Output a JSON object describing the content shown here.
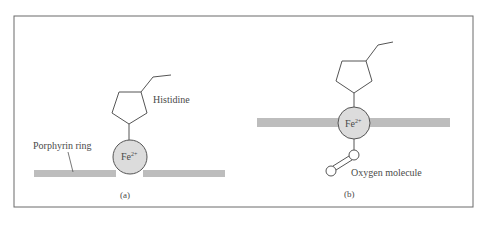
{
  "figure": {
    "panel_a": {
      "caption": "(a)",
      "labels": {
        "histidine": "Histidine",
        "porphyrin": "Porphyrin ring",
        "iron": "Fe",
        "iron_charge": "2+"
      }
    },
    "panel_b": {
      "caption": "(b)",
      "labels": {
        "iron": "Fe",
        "iron_charge": "2+",
        "oxygen": "Oxygen molecule"
      }
    },
    "colors": {
      "ring_bar": "#bdbdbd",
      "iron_fill": "#dcdcdc",
      "line": "#555555",
      "border": "#666666"
    }
  }
}
